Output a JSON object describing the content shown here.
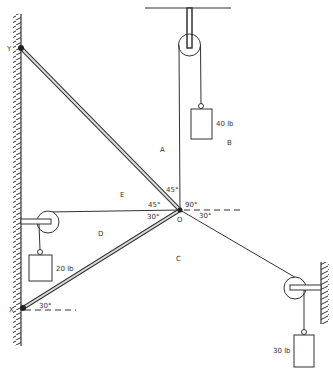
{
  "diagram": {
    "title": "",
    "points": {
      "Y": "Y",
      "X": "X",
      "O": "O"
    },
    "regions": {
      "A": "A",
      "B": "B",
      "C": "C",
      "D": "D",
      "E": "E"
    },
    "angles": {
      "top_left_45": "45°",
      "left_45": "45°",
      "right_90": "90°",
      "left_30": "30°",
      "right_30": "30°",
      "x_30": "30°"
    },
    "weights": {
      "top": "40 lb",
      "left": "20 lb",
      "right": "30 lb"
    },
    "colors": {
      "line": "#333333",
      "strut_fill": "#dddddd"
    }
  }
}
